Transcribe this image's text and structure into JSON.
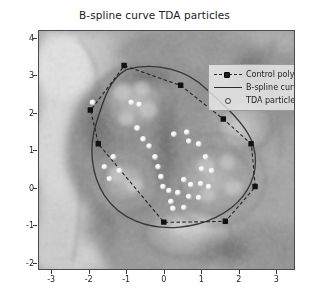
{
  "chart_data": {
    "type": "scatter",
    "title": "B-spline curve TDA particles",
    "xlabel": "",
    "ylabel": "",
    "xlim": [
      -3.35,
      3.5
    ],
    "ylim": [
      -2.2,
      4.2
    ],
    "xticks": [
      "-3",
      "-2",
      "-1",
      "0",
      "1",
      "2",
      "3"
    ],
    "xtick_values": [
      -3,
      -2,
      -1,
      0,
      1,
      2,
      3
    ],
    "yticks": [
      "4",
      "3",
      "2",
      "1",
      "0",
      "-1",
      "-2"
    ],
    "ytick_values": [
      4,
      3,
      2,
      1,
      0,
      -1,
      -2
    ],
    "grid": false,
    "legend_position": "upper right",
    "background": "grayscale micrograph image",
    "series": [
      {
        "name": "Control polygon",
        "type": "line",
        "style": "dashed-with-square-markers",
        "color": "#1c1c1c",
        "points": [
          [
            -1.05,
            3.2
          ],
          [
            0.45,
            2.65
          ],
          [
            1.6,
            1.75
          ],
          [
            2.35,
            1.1
          ],
          [
            2.45,
            -0.05
          ],
          [
            1.65,
            -1.0
          ],
          [
            0.0,
            -1.02
          ],
          [
            -1.75,
            1.1
          ],
          [
            -1.95,
            2.0
          ],
          [
            -1.05,
            3.2
          ]
        ]
      },
      {
        "name": "B-spline curve",
        "type": "line",
        "style": "solid",
        "color": "#2b2b2b"
      },
      {
        "name": "TDA particles",
        "type": "scatter",
        "marker": "circle",
        "color": "#ffffff",
        "points": [
          [
            -0.35,
            1.45
          ],
          [
            -0.2,
            1.18
          ],
          [
            -0.05,
            1.0
          ],
          [
            0.1,
            0.72
          ],
          [
            0.18,
            0.45
          ],
          [
            0.25,
            0.2
          ],
          [
            0.3,
            -0.05
          ],
          [
            0.6,
            1.3
          ],
          [
            0.95,
            1.35
          ],
          [
            1.0,
            1.12
          ],
          [
            1.25,
            1.05
          ],
          [
            1.45,
            0.72
          ],
          [
            1.35,
            0.4
          ],
          [
            0.85,
            0.12
          ],
          [
            1.05,
            0.0
          ],
          [
            1.3,
            0.02
          ],
          [
            1.5,
            -0.05
          ],
          [
            0.7,
            -0.2
          ],
          [
            1.0,
            -0.3
          ],
          [
            1.25,
            -0.32
          ],
          [
            0.45,
            -0.15
          ],
          [
            0.5,
            -0.42
          ],
          [
            -1.05,
            0.6
          ],
          [
            -1.3,
            0.35
          ],
          [
            -0.9,
            0.25
          ],
          [
            -1.15,
            0.05
          ],
          [
            -1.6,
            2.05
          ],
          [
            -0.55,
            2.05
          ],
          [
            -0.35,
            2.0
          ],
          [
            0.55,
            -0.62
          ],
          [
            0.85,
            -0.6
          ],
          [
            1.6,
            0.35
          ]
        ]
      }
    ]
  },
  "legend": {
    "items": [
      {
        "label": "Control polygon",
        "key": "dashed-square-marker"
      },
      {
        "label": "B-spline curve",
        "key": "solid-line"
      },
      {
        "label": "TDA particles",
        "key": "open-circle"
      }
    ]
  },
  "colors": {
    "control_polygon": "#1c1c1c",
    "bspline_curve": "#2b2b2b",
    "particles": "#ffffff",
    "axes_frame": "#4a4a4a",
    "figure_background": "#ffffff"
  }
}
